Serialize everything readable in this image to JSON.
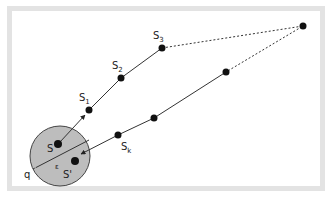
{
  "diagram": {
    "labels": {
      "s": "S",
      "s_prime": "S'",
      "s1_base": "S",
      "s1_sub": "1",
      "s2_base": "S",
      "s2_sub": "2",
      "s3_base": "S",
      "s3_sub": "3",
      "sk_base": "S",
      "sk_sub": "k",
      "q": "q",
      "epsilon": "ε"
    },
    "colors": {
      "frame": "#e3e3e3",
      "circle_fill": "#bdbdbd",
      "stroke": "#333333",
      "dot": "#111111"
    },
    "nodes": [
      {
        "id": "S",
        "x": 58,
        "y": 144
      },
      {
        "id": "S'",
        "x": 75,
        "y": 161
      },
      {
        "id": "S1",
        "x": 89,
        "y": 110
      },
      {
        "id": "S2",
        "x": 121,
        "y": 78
      },
      {
        "id": "S3",
        "x": 162,
        "y": 48
      },
      {
        "id": "far",
        "x": 303,
        "y": 26
      },
      {
        "id": "r1",
        "x": 226,
        "y": 72
      },
      {
        "id": "r2",
        "x": 154,
        "y": 118
      },
      {
        "id": "Sk",
        "x": 118,
        "y": 135
      }
    ]
  }
}
